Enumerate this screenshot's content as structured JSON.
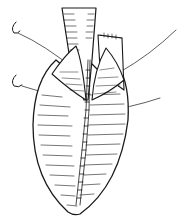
{
  "figure": {
    "colors": {
      "ink": "#1a1a1a",
      "paper": "#ffffff"
    },
    "elements": [
      "vessel",
      "right-flap",
      "left-valve-cusp",
      "right-valve-cusp",
      "organ-sac",
      "suture-line",
      "needle-upper",
      "needle-lower",
      "thread-upper-right",
      "thread-lower-right"
    ]
  }
}
